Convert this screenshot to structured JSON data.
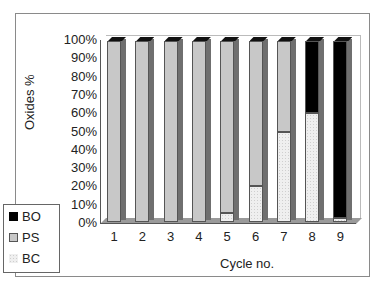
{
  "chart_data": {
    "type": "bar",
    "stacked": true,
    "percent": true,
    "title": "",
    "xlabel": "Cycle no.",
    "ylabel": "Oxides %",
    "categories": [
      "1",
      "2",
      "3",
      "4",
      "5",
      "6",
      "7",
      "8",
      "9"
    ],
    "y_ticks": [
      "0%",
      "10%",
      "20%",
      "30%",
      "40%",
      "50%",
      "60%",
      "70%",
      "80%",
      "90%",
      "100%"
    ],
    "ylim": [
      0,
      100
    ],
    "series": [
      {
        "name": "BC",
        "color": "#efefef",
        "values": [
          0,
          0,
          0,
          0,
          5,
          20,
          50,
          60,
          2
        ]
      },
      {
        "name": "PS",
        "color": "#c8c8c8",
        "values": [
          100,
          100,
          100,
          100,
          95,
          80,
          50,
          0,
          0
        ]
      },
      {
        "name": "BO",
        "color": "#000000",
        "values": [
          0,
          0,
          0,
          0,
          0,
          0,
          0,
          40,
          98
        ]
      }
    ],
    "legend": {
      "position": "left-bottom",
      "entries": [
        "BO",
        "PS",
        "BC"
      ]
    },
    "grid": false
  },
  "legend": {
    "items": [
      {
        "label": "BO",
        "color": "#000000"
      },
      {
        "label": "PS",
        "color": "#c8c8c8"
      },
      {
        "label": "BC",
        "color": "#efefef"
      }
    ]
  }
}
